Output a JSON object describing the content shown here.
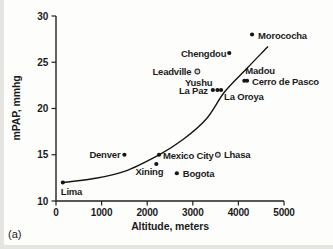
{
  "panel_label": "(a)",
  "chart_data": {
    "type": "scatter",
    "title": "",
    "xlabel": "Altitude, meters",
    "ylabel": "mPAP, mmhg",
    "xlim": [
      0,
      5000
    ],
    "ylim": [
      10,
      30
    ],
    "x_ticks": [
      0,
      1000,
      2000,
      3000,
      4000,
      5000
    ],
    "y_ticks": [
      10,
      15,
      20,
      25,
      30
    ],
    "grid": false,
    "legend": "none",
    "marker_color": "#151515",
    "open_marker_fill": "#d6d6d4",
    "curve_color": "#151515",
    "points": [
      {
        "name": "Lima",
        "x": 150,
        "y": 12,
        "marker": "filled",
        "anchor": "start",
        "dx": -2,
        "dy": 12
      },
      {
        "name": "Denver",
        "x": 1500,
        "y": 15,
        "marker": "filled",
        "anchor": "end",
        "dx": -4,
        "dy": 3.5
      },
      {
        "name": "Xining",
        "x": 2200,
        "y": 14,
        "marker": "filled",
        "anchor": "end",
        "dx": 7,
        "dy": 11
      },
      {
        "name": "Mexico City",
        "x": 2260,
        "y": 15,
        "marker": "filled",
        "anchor": "start",
        "dx": 4,
        "dy": 4
      },
      {
        "name": "Bogota",
        "x": 2650,
        "y": 13,
        "marker": "filled",
        "anchor": "start",
        "dx": 6,
        "dy": 3.5
      },
      {
        "name": "Leadville",
        "x": 3100,
        "y": 24,
        "marker": "open",
        "anchor": "end",
        "dx": -6,
        "dy": 3.5
      },
      {
        "name": "Lhasa",
        "x": 3550,
        "y": 15,
        "marker": "open",
        "anchor": "start",
        "dx": 6,
        "dy": 3.5
      },
      {
        "name": "La Paz",
        "x": 3440,
        "y": 22,
        "marker": "filled",
        "anchor": "end",
        "dx": -5,
        "dy": 4
      },
      {
        "name": "Yushu",
        "x": 3540,
        "y": 22,
        "marker": "filled",
        "anchor": "end",
        "dx": -5,
        "dy": -4
      },
      {
        "name": "La Oroya",
        "x": 3620,
        "y": 22,
        "marker": "filled",
        "anchor": "start",
        "dx": 3,
        "dy": 10
      },
      {
        "name": "Chengdou",
        "x": 3800,
        "y": 26,
        "marker": "filled",
        "anchor": "end",
        "dx": -3,
        "dy": 4
      },
      {
        "name": "Madou",
        "x": 4130,
        "y": 23,
        "marker": "filled",
        "anchor": "start",
        "dx": 1,
        "dy": -7
      },
      {
        "name": "Cerro de Pasco",
        "x": 4190,
        "y": 23,
        "marker": "filled",
        "anchor": "start",
        "dx": 5,
        "dy": 4
      },
      {
        "name": "Morococha",
        "x": 4300,
        "y": 28,
        "marker": "filled",
        "anchor": "start",
        "dx": 6,
        "dy": 4
      }
    ],
    "trend_curve": [
      [
        150,
        12
      ],
      [
        800,
        12.4
      ],
      [
        1500,
        13.2
      ],
      [
        2260,
        15
      ],
      [
        2800,
        16.7
      ],
      [
        3300,
        18.9
      ],
      [
        3700,
        21.8
      ],
      [
        4200,
        24.4
      ],
      [
        4650,
        26.7
      ]
    ]
  }
}
